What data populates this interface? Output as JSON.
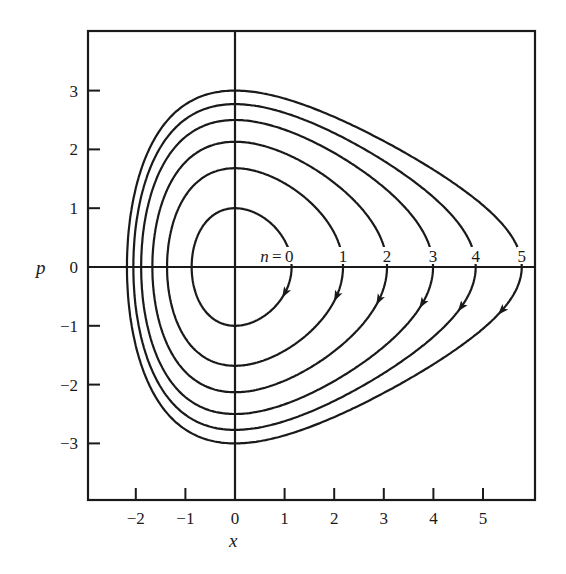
{
  "chart_data": {
    "type": "line",
    "title": "",
    "xlabel": "x",
    "ylabel": "p",
    "xlim": [
      -3.0,
      6.05
    ],
    "ylim": [
      -4.0,
      4.0
    ],
    "x_ticks": [
      "-2",
      "-1",
      "0",
      "1",
      "2",
      "3",
      "4",
      "5"
    ],
    "y_ticks": [
      "3",
      "2",
      "1",
      "0",
      "-1",
      "-2",
      "-3"
    ],
    "grid": false,
    "potential_model": {
      "form": "p^2 + D(1 - e^(-a x))^2 = E",
      "D": 14.6,
      "a": 0.266
    },
    "series": [
      {
        "name": "n = 0",
        "label": "n = 0",
        "p_max": 1.0,
        "x_min": -0.85,
        "x_max": 1.17
      },
      {
        "name": "n = 1",
        "label": "1",
        "p_max": 1.68,
        "x_min": -1.35,
        "x_max": 2.2
      },
      {
        "name": "n = 2",
        "label": "2",
        "p_max": 2.13,
        "x_min": -1.65,
        "x_max": 3.1
      },
      {
        "name": "n = 3",
        "label": "3",
        "p_max": 2.5,
        "x_min": -1.87,
        "x_max": 3.97
      },
      {
        "name": "n = 4",
        "label": "4",
        "p_max": 2.77,
        "x_min": -2.04,
        "x_max": 4.86
      },
      {
        "name": "n = 5",
        "label": "5",
        "p_max": 3.0,
        "x_min": -2.18,
        "x_max": 5.75
      }
    ],
    "annotations": [
      "n = 0",
      "1",
      "2",
      "3",
      "4",
      "5"
    ],
    "arrow_direction": "clockwise (downward at right turning point)"
  }
}
